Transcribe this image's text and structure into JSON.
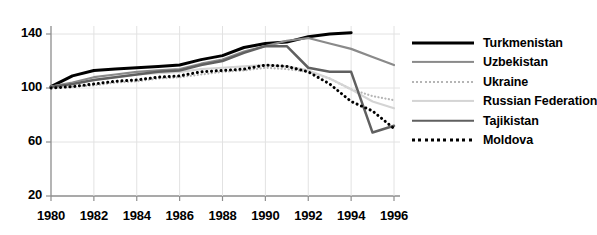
{
  "chart_data": {
    "type": "line",
    "title": "",
    "subtitle": "",
    "xlabel": "",
    "ylabel": "",
    "xlim": [
      1980,
      1996
    ],
    "ylim": [
      20,
      150
    ],
    "yticks": [
      20,
      60,
      100,
      140
    ],
    "xticks": [
      1980,
      1982,
      1984,
      1986,
      1988,
      1990,
      1992,
      1994,
      1996
    ],
    "ytick_labels": [
      "20",
      "60",
      "100",
      "140"
    ],
    "xtick_labels": [
      "1980",
      "1982",
      "1984",
      "1986",
      "1988",
      "1990",
      "1992",
      "1994",
      "1996"
    ],
    "grid": true,
    "grid_axis": "both",
    "legend_position": "right",
    "x": [
      1980,
      1981,
      1982,
      1983,
      1984,
      1985,
      1986,
      1987,
      1988,
      1989,
      1990,
      1991,
      1992,
      1993,
      1994,
      1995,
      1996
    ],
    "series": [
      {
        "name": "Turkmenistan",
        "color": "#000000",
        "style": "solid",
        "width": 3,
        "values": [
          101,
          109,
          113,
          114,
          115,
          116,
          117,
          121,
          124,
          130,
          133,
          134,
          138,
          140,
          141,
          null,
          null
        ]
      },
      {
        "name": "Uzbekistan",
        "color": "#8a8a8a",
        "style": "solid",
        "width": 2.2,
        "values": [
          101,
          104,
          108,
          110,
          112,
          113,
          114,
          118,
          121,
          127,
          131,
          135,
          137,
          133,
          129,
          123,
          117
        ]
      },
      {
        "name": "Ukraine",
        "color": "#b5b5b5",
        "style": "dotted",
        "width": 2.2,
        "values": [
          100,
          101,
          102,
          104,
          105,
          107,
          108,
          110,
          112,
          113,
          115,
          114,
          112,
          107,
          99,
          94,
          91
        ]
      },
      {
        "name": "Russian Federation",
        "color": "#d4d4d4",
        "style": "solid",
        "width": 2.2,
        "values": [
          101,
          103,
          106,
          108,
          110,
          111,
          112,
          114,
          115,
          116,
          117,
          116,
          113,
          107,
          99,
          90,
          85
        ]
      },
      {
        "name": "Tajikistan",
        "color": "#606060",
        "style": "solid",
        "width": 2.5,
        "values": [
          101,
          103,
          106,
          108,
          110,
          112,
          113,
          117,
          120,
          126,
          131,
          131,
          115,
          112,
          112,
          67,
          72
        ]
      },
      {
        "name": "Moldova",
        "color": "#000000",
        "style": "dotted",
        "width": 3,
        "values": [
          100,
          101,
          103,
          105,
          106,
          108,
          109,
          112,
          113,
          114,
          117,
          116,
          112,
          103,
          90,
          83,
          70
        ]
      }
    ]
  },
  "legend": {
    "items": [
      {
        "label": "Turkmenistan"
      },
      {
        "label": "Uzbekistan"
      },
      {
        "label": "Ukraine"
      },
      {
        "label": "Russian Federation"
      },
      {
        "label": "Tajikistan"
      },
      {
        "label": "Moldova"
      }
    ]
  }
}
